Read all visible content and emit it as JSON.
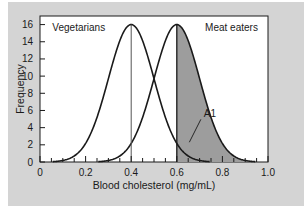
{
  "chart_data": {
    "type": "line",
    "title": "",
    "xlabel": "Blood cholesterol (mg/mL)",
    "ylabel": "Frequency",
    "xlim": [
      0,
      1.0
    ],
    "ylim": [
      0,
      17
    ],
    "grid": false,
    "legend_position": "inline-annotations",
    "xticks": [
      0,
      0.2,
      0.4,
      0.6,
      0.8,
      1.0
    ],
    "xtick_labels": [
      "0",
      "0.2",
      "0.4",
      "0.6",
      "0.8",
      "1.0"
    ],
    "xminor_tick_step": 0.05,
    "yticks": [
      0,
      2,
      4,
      6,
      8,
      10,
      12,
      14,
      16
    ],
    "ytick_labels": [
      "0",
      "2",
      "4",
      "6",
      "8",
      "10",
      "12",
      "14",
      "16"
    ],
    "series": [
      {
        "name": "Vegetarians",
        "kind": "normal-curve",
        "mean": 0.4,
        "sigma": 0.1,
        "peak": 16,
        "mean_line": true,
        "label_x": 0.17,
        "label_y": 15.2
      },
      {
        "name": "Meat eaters",
        "kind": "normal-curve",
        "mean": 0.6,
        "sigma": 0.1,
        "peak": 16,
        "mean_line": true,
        "label_x": 0.84,
        "label_y": 15.2
      }
    ],
    "shaded_region": {
      "label": "A1",
      "series": "Meat eaters",
      "x_from": 0.6,
      "x_to": 0.94,
      "fill_color": "#9d9d9d",
      "label_x": 0.745,
      "label_y": 5.2
    },
    "curve_color": "#1a1a1a",
    "axis_color": "#1a1a1a",
    "plot_background": "#ffffff",
    "figure_background": "#d4d4d4"
  },
  "axes": {
    "x_title": "Blood cholesterol (mg/mL)",
    "y_title": "Frequency"
  },
  "annotations": {
    "left_curve_label": "Vegetarians",
    "right_curve_label": "Meat eaters",
    "area_label": "A1"
  }
}
